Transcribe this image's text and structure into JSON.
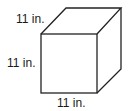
{
  "figure": {
    "type": "cube",
    "labels": {
      "depth": "11 in.",
      "height": "11 in.",
      "width": "11 in."
    },
    "stroke_color": "#222222",
    "background": "#ffffff"
  }
}
